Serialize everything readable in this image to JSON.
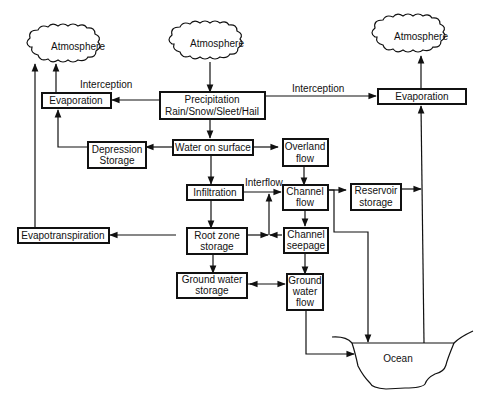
{
  "diagram": {
    "clouds": {
      "left": "Atmosphere",
      "center": "Atmosphere",
      "right": "Atmosphere"
    },
    "boxes": {
      "precipitation_line1": "Precipitation",
      "precipitation_line2": "Rain/Snow/Sleet/Hail",
      "evaporation_left": "Evaporation",
      "evaporation_right": "Evaporation",
      "depression_line1": "Depression",
      "depression_line2": "Storage",
      "water_on_surface": "Water on surface",
      "overland_line1": "Overland",
      "overland_line2": "flow",
      "infiltration": "Infiltration",
      "channel_flow_line1": "Channel",
      "channel_flow_line2": "flow",
      "reservoir_line1": "Reservoir",
      "reservoir_line2": "storage",
      "evapotranspiration": "Evapotranspiration",
      "root_zone_line1": "Root  zone",
      "root_zone_line2": "storage",
      "channel_seepage_line1": "Channel",
      "channel_seepage_line2": "seepage",
      "gw_storage_line1": "Ground water",
      "gw_storage_line2": "storage",
      "gw_flow_line1": "Ground",
      "gw_flow_line2": "water",
      "gw_flow_line3": "flow"
    },
    "edge_labels": {
      "interception_left": "Interception",
      "interception_right": "Interception",
      "interflow": "Interflow"
    },
    "ocean": "Ocean",
    "colors": {
      "stroke": "#111111",
      "background": "#ffffff"
    }
  }
}
